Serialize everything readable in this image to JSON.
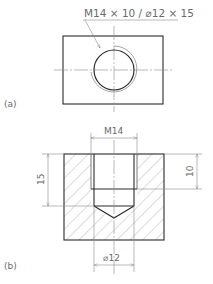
{
  "figure": {
    "view_a": {
      "label": "(a)",
      "callout": "M14 × 10 / ⌀12 × 15"
    },
    "view_b": {
      "label": "(b)",
      "dim_top": "M14",
      "dim_left": "15",
      "dim_right": "10",
      "dim_bottom": "⌀12"
    }
  },
  "colors": {
    "outline": "#2a2a2a",
    "thin": "#8a8a8a",
    "text": "#6a6a6a"
  }
}
